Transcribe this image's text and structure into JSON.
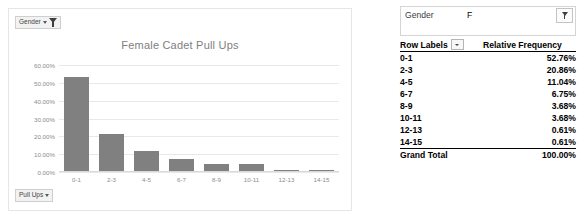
{
  "chart_panel": {
    "gender_field_button": {
      "label": "Gender",
      "icons": [
        "chevron-down-icon",
        "filter-funnel-icon"
      ]
    },
    "pullups_field_button": {
      "label": "Pull Ups",
      "icons": [
        "chevron-down-icon"
      ]
    }
  },
  "pivot": {
    "filter_field": "Gender",
    "filter_value": "F",
    "filter_icon": "filter-funnel-icon",
    "columns": [
      "Row Labels",
      "Relative Frequency"
    ],
    "rows": [
      {
        "label": "0-1",
        "value": "52.76%"
      },
      {
        "label": "2-3",
        "value": "20.86%"
      },
      {
        "label": "4-5",
        "value": "11.04%"
      },
      {
        "label": "6-7",
        "value": "6.75%"
      },
      {
        "label": "8-9",
        "value": "3.68%"
      },
      {
        "label": "10-11",
        "value": "3.68%"
      },
      {
        "label": "12-13",
        "value": "0.61%"
      },
      {
        "label": "14-15",
        "value": "0.61%"
      }
    ],
    "total": {
      "label": "Grand Total",
      "value": "100.00%"
    }
  },
  "chart_data": {
    "type": "bar",
    "title": "Female Cadet Pull Ups",
    "xlabel": "",
    "ylabel": "",
    "categories": [
      "0-1",
      "2-3",
      "4-5",
      "6-7",
      "8-9",
      "10-11",
      "12-13",
      "14-15"
    ],
    "values": [
      52.76,
      20.86,
      11.04,
      6.75,
      3.68,
      3.68,
      0.61,
      0.61
    ],
    "value_labels": [
      "52.76%",
      "20.86%",
      "11.04%",
      "6.75%",
      "3.68%",
      "3.68%",
      "0.61%",
      "0.61%"
    ],
    "ylim": [
      0,
      60
    ],
    "yticks": [
      0,
      10,
      20,
      30,
      40,
      50,
      60
    ],
    "ytick_labels": [
      "0.00%",
      "10.00%",
      "20.00%",
      "30.00%",
      "40.00%",
      "50.00%",
      "60.00%"
    ],
    "grid": true,
    "legend": false,
    "bar_color": "#808080",
    "gridline_color": "#e8e8e8",
    "title_color": "#808080",
    "tick_color": "#8c8c8c"
  }
}
